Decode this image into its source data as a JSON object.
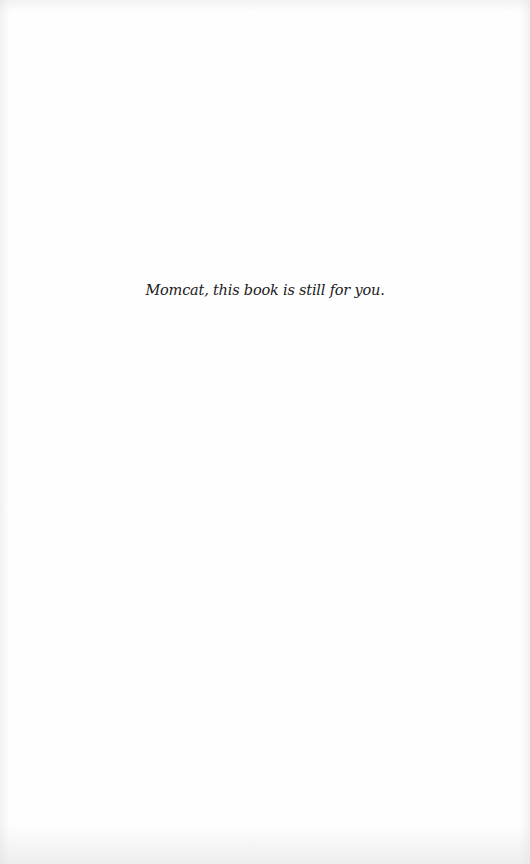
{
  "page": {
    "type": "dedication",
    "dedication_text": "Momcat, this book is still for you.",
    "colors": {
      "paper": "#fefefe",
      "text": "#1a1a1a"
    }
  }
}
